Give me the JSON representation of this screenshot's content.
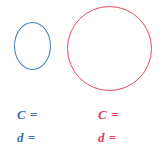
{
  "page": {
    "background_color": "#fefefe"
  },
  "figures": [
    {
      "id": "small-circle",
      "shape": "circle",
      "color": "#4a7ebb",
      "color_name": "blue",
      "center_x": 32,
      "center_y": 46,
      "radius": 18,
      "stroke_width": 1.4
    },
    {
      "id": "large-circle",
      "shape": "circle",
      "color": "#e24a5e",
      "color_name": "red",
      "center_x": 110,
      "center_y": 48,
      "radius": 42,
      "stroke_width": 1.4
    }
  ],
  "answer_blanks": {
    "left": {
      "color": "#3d6fb4",
      "circumference_label": "C =",
      "diameter_label": "d ="
    },
    "right": {
      "color": "#e0415a",
      "circumference_label": "C =",
      "diameter_label": "d ="
    }
  }
}
